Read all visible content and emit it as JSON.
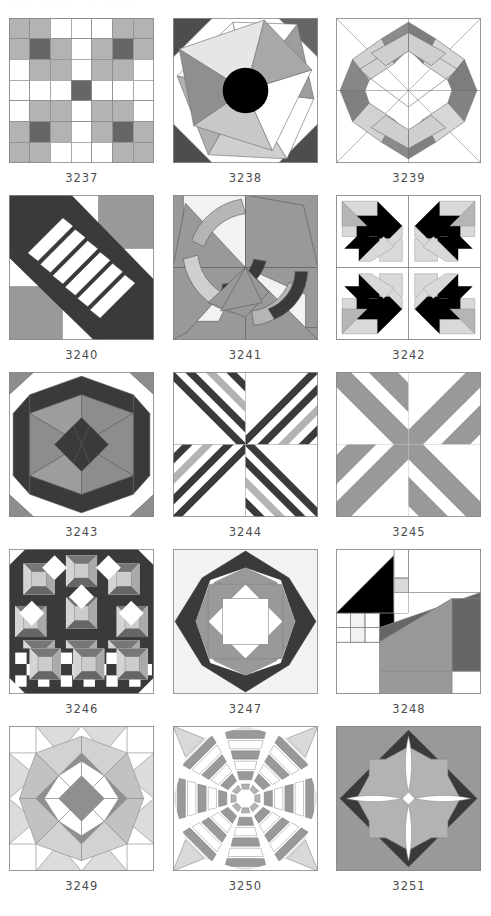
{
  "page": {
    "masthead_text": "QUILT BLOCK PATTERNS",
    "background_color": "#ffffff",
    "caption_color": "#4c4c4c",
    "columns": 3,
    "rows": 5
  },
  "palette": {
    "white": "#ffffff",
    "offwhite": "#f4f4f4",
    "light_gray": "#d9d9d9",
    "mid_gray": "#b3b3b3",
    "gray": "#999999",
    "dark_gray": "#666666",
    "darker_gray": "#4d4d4d",
    "charcoal": "#3a3a3a",
    "black": "#000000",
    "outline": "#7a7a7a"
  },
  "blocks": [
    {
      "id": "3237",
      "name": "nine-patch-cross",
      "caption": "3237",
      "description": "Seven by seven patch grid forming a white cross with gray and dark gray nine-patch corners",
      "colors": [
        "#ffffff",
        "#b3b3b3",
        "#666666"
      ]
    },
    {
      "id": "3238",
      "name": "pinwheel-star-with-center-circle",
      "caption": "3238",
      "description": "Twelve point spinning blade star radiating from a solid black center circle on white with dark corner triangles",
      "colors": [
        "#ffffff",
        "#d9d9d9",
        "#b3b3b3",
        "#999999",
        "#666666",
        "#4d4d4d",
        "#000000"
      ]
    },
    {
      "id": "3239",
      "name": "interlocking-octagon-ribbon",
      "caption": "3239",
      "description": "Outlined square with interlocking gray ribbon bands forming an octagonal wreath over diagonal guide lines",
      "colors": [
        "#ffffff",
        "#d9d9d9",
        "#999999",
        "#666666"
      ]
    },
    {
      "id": "3240",
      "name": "jacobs-ladder-diagonal",
      "caption": "3240",
      "description": "Diagonal dark ladder with white rungs crossing from upper left to lower right over gray and white quadrants",
      "colors": [
        "#ffffff",
        "#999999",
        "#4d4d4d",
        "#3a3a3a"
      ]
    },
    {
      "id": "3241",
      "name": "crescent-pinwheel",
      "caption": "3241",
      "description": "Four curved crescent arcs spinning around center with light triangles on gray pinwheel ground",
      "colors": [
        "#ffffff",
        "#f4f4f4",
        "#d9d9d9",
        "#999999",
        "#666666",
        "#3a3a3a"
      ]
    },
    {
      "id": "3242",
      "name": "four-patch-bear-paw-arrows",
      "caption": "3242",
      "description": "Two by two arrangement of black arrow and light gray pinwheel blocks",
      "colors": [
        "#ffffff",
        "#d9d9d9",
        "#999999",
        "#000000"
      ]
    },
    {
      "id": "3243",
      "name": "kaleidoscope-star-hexagon",
      "caption": "3243",
      "description": "Dark hexagonal outer frame enclosing a gray four point star with dark center diamonds",
      "colors": [
        "#ffffff",
        "#999999",
        "#666666",
        "#3a3a3a"
      ]
    },
    {
      "id": "3244",
      "name": "chevron-x-stripes-narrow",
      "caption": "3244",
      "description": "Four quadrants of nested dark and white chevron stripes converging to a white center diamond",
      "colors": [
        "#ffffff",
        "#b3b3b3",
        "#666666",
        "#3a3a3a"
      ]
    },
    {
      "id": "3245",
      "name": "chevron-x-stripes-wide",
      "caption": "3245",
      "description": "Bold gray X with wide nested chevrons on white ground",
      "colors": [
        "#ffffff",
        "#b3b3b3",
        "#999999",
        "#666666"
      ]
    },
    {
      "id": "3246",
      "name": "complex-sampler-checkerboard",
      "caption": "3246",
      "description": "Dense sampler of pinwheels and tipped squares above a black and white checkerboard band",
      "colors": [
        "#ffffff",
        "#d9d9d9",
        "#b3b3b3",
        "#999999",
        "#666666",
        "#3a3a3a",
        "#000000"
      ]
    },
    {
      "id": "3247",
      "name": "rolling-stone-octagon",
      "caption": "3247",
      "description": "Dark eight point star frame around a gray octagon with a white center square",
      "colors": [
        "#f4f4f4",
        "#ffffff",
        "#999999",
        "#3a3a3a"
      ]
    },
    {
      "id": "3248",
      "name": "attic-window-house",
      "caption": "3248",
      "description": "Asymmetric pieced block with a black triangle roof and large gray diagonal body with small corner patches",
      "colors": [
        "#ffffff",
        "#f4f4f4",
        "#d9d9d9",
        "#999999",
        "#666666",
        "#000000"
      ]
    },
    {
      "id": "3249",
      "name": "lemoyne-star-with-corner-kites",
      "caption": "3249",
      "description": "Eight point star with dark gray center diamonds and pale kite shaped outer points",
      "colors": [
        "#ffffff",
        "#f4f4f4",
        "#d9d9d9",
        "#b3b3b3",
        "#999999",
        "#666666"
      ]
    },
    {
      "id": "3250",
      "name": "spider-web-octagon-strips",
      "caption": "3250",
      "description": "Octagonal spider web of concentric gray and white strip rings radiating from center",
      "colors": [
        "#ffffff",
        "#d9d9d9",
        "#b3b3b3",
        "#999999",
        "#666666"
      ]
    },
    {
      "id": "3251",
      "name": "orange-peel-diamond",
      "caption": "3251",
      "description": "Gray diamond on darker ground with white petal shapes and a light gray octagon center",
      "colors": [
        "#ffffff",
        "#b3b3b3",
        "#999999",
        "#666666",
        "#3a3a3a"
      ]
    }
  ]
}
